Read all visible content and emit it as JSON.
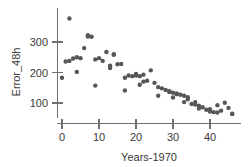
{
  "chart_data": {
    "type": "scatter",
    "title": "",
    "xlabel": "Years-1970",
    "ylabel": "Error_48h",
    "xlim": [
      -2,
      48
    ],
    "ylim": [
      45,
      390
    ],
    "grid": false,
    "legend": null,
    "marker": {
      "shape": "circle",
      "color": "#565656",
      "size": 2.2
    },
    "xticks": [
      0,
      10,
      20,
      30,
      40
    ],
    "xtick_labels": [
      "0",
      "10",
      "20",
      "30",
      "40"
    ],
    "yticks": [
      100,
      200,
      300
    ],
    "ytick_labels": [
      "100",
      "200",
      "300"
    ],
    "x": [
      0,
      1,
      2,
      2,
      3,
      4,
      4,
      5,
      6,
      7,
      7,
      8,
      9,
      9,
      10,
      11,
      12,
      13,
      13,
      14,
      14,
      15,
      16,
      17,
      17,
      18,
      19,
      20,
      20,
      21,
      21,
      22,
      22,
      23,
      24,
      25,
      26,
      26,
      27,
      28,
      29,
      29,
      30,
      30,
      31,
      31,
      32,
      33,
      33,
      34,
      34,
      35,
      36,
      36,
      37,
      37,
      38,
      39,
      40,
      40,
      41,
      42,
      42,
      43,
      44,
      45,
      46,
      46
    ],
    "y": [
      183,
      236,
      377,
      238,
      246,
      202,
      250,
      247,
      280,
      318,
      322,
      317,
      243,
      157,
      247,
      238,
      267,
      222,
      215,
      260,
      258,
      227,
      228,
      183,
      141,
      190,
      188,
      195,
      190,
      188,
      160,
      170,
      193,
      173,
      207,
      166,
      152,
      124,
      148,
      143,
      139,
      136,
      134,
      118,
      131,
      129,
      127,
      124,
      103,
      119,
      112,
      97,
      103,
      95,
      91,
      82,
      86,
      78,
      80,
      72,
      70,
      69,
      93,
      75,
      101,
      84,
      65,
      64
    ],
    "series": [
      {
        "name": "Error_48h",
        "points": [
          [
            0,
            183
          ],
          [
            1,
            236
          ],
          [
            2,
            377
          ],
          [
            2,
            238
          ],
          [
            3,
            246
          ],
          [
            4,
            202
          ],
          [
            4,
            250
          ],
          [
            5,
            247
          ],
          [
            6,
            280
          ],
          [
            7,
            318
          ],
          [
            7,
            322
          ],
          [
            8,
            317
          ],
          [
            9,
            243
          ],
          [
            9,
            157
          ],
          [
            10,
            247
          ],
          [
            11,
            238
          ],
          [
            12,
            267
          ],
          [
            13,
            222
          ],
          [
            13,
            215
          ],
          [
            14,
            260
          ],
          [
            14,
            258
          ],
          [
            15,
            227
          ],
          [
            16,
            228
          ],
          [
            17,
            183
          ],
          [
            17,
            141
          ],
          [
            18,
            190
          ],
          [
            19,
            188
          ],
          [
            20,
            195
          ],
          [
            20,
            190
          ],
          [
            21,
            188
          ],
          [
            21,
            160
          ],
          [
            22,
            170
          ],
          [
            22,
            193
          ],
          [
            23,
            173
          ],
          [
            24,
            207
          ],
          [
            25,
            166
          ],
          [
            26,
            152
          ],
          [
            26,
            124
          ],
          [
            27,
            148
          ],
          [
            28,
            143
          ],
          [
            29,
            139
          ],
          [
            29,
            136
          ],
          [
            30,
            134
          ],
          [
            30,
            118
          ],
          [
            31,
            131
          ],
          [
            31,
            129
          ],
          [
            32,
            127
          ],
          [
            33,
            124
          ],
          [
            33,
            103
          ],
          [
            34,
            119
          ],
          [
            34,
            112
          ],
          [
            35,
            97
          ],
          [
            36,
            103
          ],
          [
            36,
            95
          ],
          [
            37,
            91
          ],
          [
            37,
            82
          ],
          [
            38,
            86
          ],
          [
            39,
            78
          ],
          [
            40,
            80
          ],
          [
            40,
            72
          ],
          [
            41,
            70
          ],
          [
            42,
            69
          ],
          [
            42,
            93
          ],
          [
            43,
            75
          ],
          [
            44,
            101
          ],
          [
            45,
            84
          ],
          [
            46,
            65
          ],
          [
            46,
            64
          ]
        ]
      }
    ]
  },
  "figure": {
    "x_axis_title": "Years-1970",
    "y_axis_title": "Error_48h",
    "x_tick_labels": [
      "0",
      "10",
      "20",
      "30",
      "40"
    ],
    "y_tick_labels": [
      "300",
      "200",
      "100"
    ]
  }
}
